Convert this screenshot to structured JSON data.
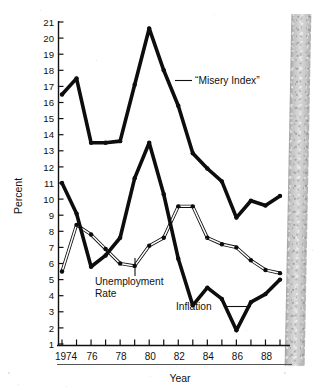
{
  "chart_data": {
    "type": "line",
    "title": "",
    "xlabel": "Year",
    "ylabel": "Percent",
    "xlim": [
      1974,
      1989
    ],
    "ylim": [
      0,
      21
    ],
    "ytick_step": 1,
    "yticks": [
      1,
      2,
      3,
      4,
      5,
      6,
      7,
      8,
      9,
      10,
      11,
      12,
      13,
      14,
      15,
      16,
      17,
      18,
      19,
      20,
      21
    ],
    "x": [
      1974,
      1975,
      1976,
      1977,
      1978,
      1979,
      1980,
      1981,
      1982,
      1983,
      1984,
      1985,
      1986,
      1987,
      1988,
      1989
    ],
    "xtick_labels": [
      "1974",
      "",
      "76",
      "",
      "78",
      "",
      "80",
      "",
      "82",
      "",
      "84",
      "",
      "86",
      "",
      "88",
      ""
    ],
    "grid": false,
    "legend": "none",
    "series": [
      {
        "name": "“Misery Index”",
        "style": "thick-black",
        "values": [
          16.5,
          17.5,
          13.5,
          13.5,
          13.6,
          17.1,
          20.6,
          18.0,
          15.8,
          12.85,
          11.9,
          11.1,
          8.85,
          9.9,
          9.6,
          10.2
        ]
      },
      {
        "name": "Unemployment Rate",
        "style": "thin-outlined",
        "values": [
          5.5,
          8.4,
          7.8,
          6.9,
          6.0,
          5.85,
          7.1,
          7.6,
          9.55,
          9.55,
          7.6,
          7.2,
          7.0,
          6.2,
          5.6,
          5.4
        ]
      },
      {
        "name": "Inflation",
        "style": "thick-black",
        "values": [
          11.0,
          9.1,
          5.8,
          6.5,
          7.6,
          11.3,
          13.5,
          10.3,
          6.3,
          3.4,
          4.5,
          3.8,
          1.85,
          3.6,
          4.1,
          5.0
        ]
      }
    ],
    "annotations": [
      {
        "text": "“Misery Index”",
        "target_year": 1981,
        "target_value": 17.0
      },
      {
        "text": "Unemployment",
        "target_year": 1978.6,
        "target_value": 5.9
      },
      {
        "text": "Rate",
        "target_year": 1978.6,
        "target_value": 5.9
      },
      {
        "text": "Inflation",
        "target_year": 1985.9,
        "target_value": 2.0
      }
    ]
  },
  "axes": {
    "y_axis_title": "Percent",
    "x_axis_title": "Year"
  }
}
